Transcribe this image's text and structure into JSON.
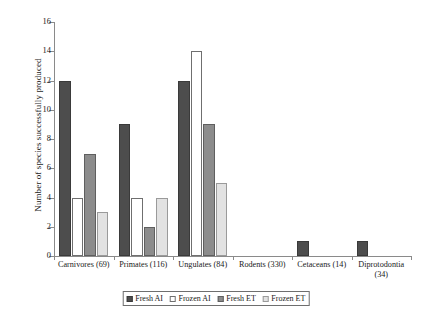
{
  "chart_data": {
    "type": "bar",
    "title": "",
    "xlabel": "",
    "ylabel": "Number of species successfully produced",
    "ylim": [
      0,
      16
    ],
    "ytick_step": 2,
    "yticks": [
      0,
      2,
      4,
      6,
      8,
      10,
      12,
      14,
      16
    ],
    "grid": false,
    "legend_position": "bottom",
    "categories": [
      "Carnivores (69)",
      "Primates (116)",
      "Ungulates (84)",
      "Rodents (330)",
      "Cetaceans (14)",
      "Diprotodontia\n(34)"
    ],
    "series": [
      {
        "name": "Fresh AI",
        "color": "#4d4d4d",
        "values": [
          12,
          9,
          12,
          0,
          1,
          1
        ]
      },
      {
        "name": "Frozen AI",
        "color": "#ffffff",
        "values": [
          4,
          4,
          14,
          0,
          0,
          0
        ]
      },
      {
        "name": "Fresh ET",
        "color": "#8c8c8c",
        "values": [
          7,
          2,
          9,
          0,
          0,
          0
        ]
      },
      {
        "name": "Frozen ET",
        "color": "#e2e2e2",
        "values": [
          3,
          4,
          5,
          0,
          0,
          0
        ]
      }
    ]
  },
  "axis": {
    "y_title": "Number of species successfully produced",
    "y_tick_labels": [
      "0",
      "2",
      "4",
      "6",
      "8",
      "10",
      "12",
      "14",
      "16"
    ]
  },
  "legend": {
    "entries": [
      {
        "label": "Fresh AI"
      },
      {
        "label": "Frozen AI"
      },
      {
        "label": "Fresh ET"
      },
      {
        "label": "Frozen ET"
      }
    ]
  }
}
